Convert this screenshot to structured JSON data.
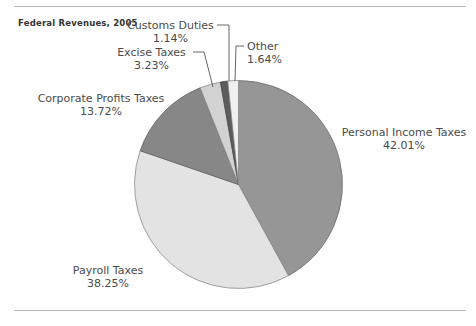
{
  "chart_data": {
    "type": "pie",
    "title": "Federal Revenues, 2005",
    "xlabel": "",
    "ylabel": "",
    "legend": "none",
    "grid": false,
    "categories": [
      "Personal Income Taxes",
      "Payroll Taxes",
      "Corporate Profits Taxes",
      "Excise Taxes",
      "Customs Duties",
      "Other"
    ],
    "values": [
      42.01,
      38.25,
      13.72,
      3.23,
      1.14,
      1.64
    ],
    "value_labels": [
      "42.01%",
      "38.25%",
      "13.72%",
      "3.23%",
      "1.14%",
      "1.64%"
    ],
    "slice_colors": [
      "#969696",
      "#e3e3e3",
      "#878787",
      "#d2d2d2",
      "#5c5c5c",
      "#f0f0f0"
    ],
    "units": "percent",
    "start_angle_deg": 0,
    "direction": "clockwise"
  },
  "chart": {
    "title": "Federal Revenues, 2005",
    "labels": [
      {
        "name": "Customs Duties",
        "pct": "1.14%"
      },
      {
        "name": "Excise Taxes",
        "pct": "3.23%"
      },
      {
        "name": "Other",
        "pct": "1.64%"
      },
      {
        "name": "Corporate Profits Taxes",
        "pct": "13.72%"
      },
      {
        "name": "Personal Income Taxes",
        "pct": "42.01%"
      },
      {
        "name": "Payroll Taxes",
        "pct": "38.25%"
      }
    ]
  }
}
